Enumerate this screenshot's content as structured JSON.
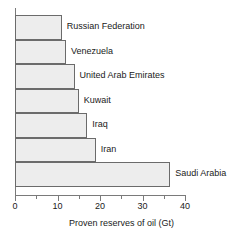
{
  "chart_data": {
    "type": "bar",
    "orientation": "horizontal",
    "title": "",
    "xlabel": "Proven reserves of oil (Gt)",
    "ylabel": "",
    "xlim": [
      0,
      40
    ],
    "grid": false,
    "legend": false,
    "categories": [
      "Russian Federation",
      "Venezuela",
      "United Arab Emirates",
      "Kuwait",
      "Iraq",
      "Iran",
      "Saudi Arabia"
    ],
    "values": [
      11,
      12,
      14,
      15,
      17,
      19,
      36.5
    ],
    "xticks": [
      0,
      10,
      20,
      30,
      40
    ],
    "xtick_labels": [
      "0",
      "10",
      "20",
      "30",
      "40"
    ],
    "xminor_ticks": [
      5,
      15,
      25,
      35
    ],
    "colors": {
      "bar_fill": "#ededed",
      "bar_border": "#6b6b6b",
      "axis": "#7a7a7a",
      "text": "#1a1a1a",
      "background": "#ffffff"
    }
  },
  "axis": {
    "title": "Proven reserves of oil (Gt)",
    "ticks": [
      {
        "label": "0",
        "value": 0
      },
      {
        "label": "10",
        "value": 10
      },
      {
        "label": "20",
        "value": 20
      },
      {
        "label": "30",
        "value": 30
      },
      {
        "label": "40",
        "value": 40
      }
    ]
  },
  "bars": [
    {
      "label": "Russian Federation",
      "value": 11
    },
    {
      "label": "Venezuela",
      "value": 12
    },
    {
      "label": "United Arab Emirates",
      "value": 14
    },
    {
      "label": "Kuwait",
      "value": 15
    },
    {
      "label": "Iraq",
      "value": 17
    },
    {
      "label": "Iran",
      "value": 19
    },
    {
      "label": "Saudi Arabia",
      "value": 36.5
    }
  ]
}
